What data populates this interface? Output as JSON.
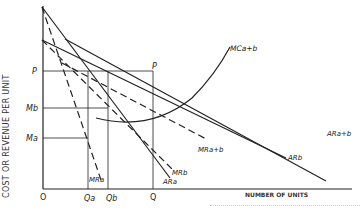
{
  "figure": {
    "y_axis_label": "COST OR REVENUE PER UNIT",
    "x_axis_label": "NUMBER OF UNITS",
    "y_ticks": {
      "p": "P",
      "mb": "Mb",
      "ma": "Ma",
      "origin": "O"
    },
    "x_ticks": {
      "origin": "O",
      "qa": "Qa",
      "qb": "Qb",
      "q": "Q"
    },
    "point_labels": {
      "p_on_demand": "P"
    },
    "curves": {
      "mc_ab": "MCa+b",
      "ar_ab": "ARa+b",
      "ar_b": "ARb",
      "mr_ab": "MRa+b",
      "mr_b": "MRb",
      "ar_a": "ARa",
      "mr_a": "MRa"
    },
    "colors": {
      "ink": "#222222",
      "background": "#ffffff"
    }
  }
}
